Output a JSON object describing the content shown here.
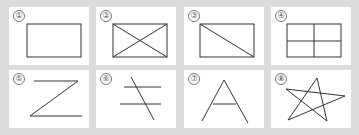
{
  "figures": [
    {
      "id": "1",
      "label": "①",
      "shape": "rectangle"
    },
    {
      "id": "2",
      "label": "②",
      "shape": "rectangle-with-both-diagonals"
    },
    {
      "id": "3",
      "label": "③",
      "shape": "rectangle-with-one-diagonal"
    },
    {
      "id": "4",
      "label": "④",
      "shape": "rectangle-divided-into-four"
    },
    {
      "id": "5",
      "label": "⑤",
      "shape": "letter-z"
    },
    {
      "id": "6",
      "label": "⑥",
      "shape": "two-parallel-lines-crossed"
    },
    {
      "id": "7",
      "label": "⑦",
      "shape": "letter-a"
    },
    {
      "id": "8",
      "label": "⑧",
      "shape": "five-pointed-star"
    }
  ]
}
